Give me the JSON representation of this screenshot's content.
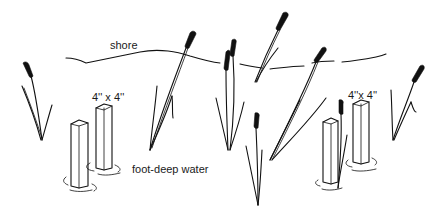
{
  "illustration": {
    "description": "Pen sketch of two pairs of 4x4 wooden posts standing in foot-deep water among cattail reeds, with a shoreline behind",
    "labels": {
      "shore": "shore",
      "post_left": "4'' x 4''",
      "post_right": "4''x 4''",
      "water": "foot-deep water"
    },
    "colors": {
      "ink": "#111111",
      "background": "#ffffff"
    }
  }
}
